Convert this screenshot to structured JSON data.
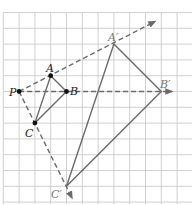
{
  "figure": {
    "type": "dilation-diagram",
    "grid": {
      "origin_x": 3.3,
      "origin_y": 12.5,
      "cell": 15.8,
      "cols": 12,
      "rows": 12
    },
    "center": {
      "label": "P",
      "x": 1,
      "y": 5
    },
    "scale_factor": 3,
    "original_triangle": [
      {
        "label": "A",
        "x": 3,
        "y": 4
      },
      {
        "label": "B",
        "x": 4,
        "y": 5
      },
      {
        "label": "C",
        "x": 2,
        "y": 7
      }
    ],
    "image_triangle": [
      {
        "label": "A′",
        "x": 7,
        "y": 2
      },
      {
        "label": "B′",
        "x": 10,
        "y": 5
      },
      {
        "label": "C′",
        "x": 4,
        "y": 11
      }
    ],
    "colors": {
      "grid": "#c4c4c4",
      "lines": "#6a6a6a",
      "points": "#111111"
    }
  },
  "labels": {
    "P": "P",
    "A": "A",
    "B": "B",
    "C": "C",
    "A_prime": "A′",
    "B_prime": "B′",
    "C_prime": "C′"
  }
}
